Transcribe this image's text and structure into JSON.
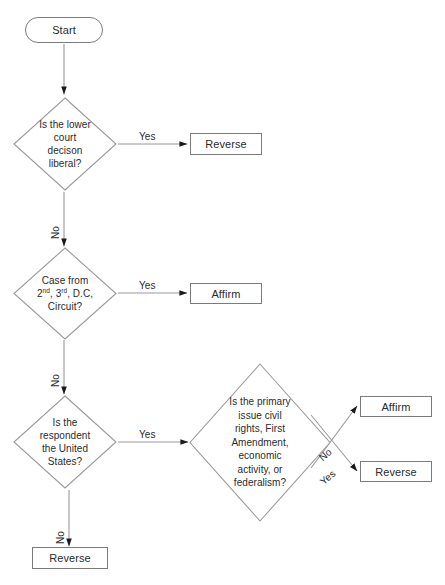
{
  "diagram": {
    "type": "flowchart",
    "colors": {
      "stroke": "#7b7b7b",
      "arrow": "#1a1a1a",
      "text": "#2b2b2b",
      "background": "#ffffff"
    },
    "nodes": {
      "start": {
        "label": "Start",
        "shape": "terminator"
      },
      "decision_liberal": {
        "shape": "diamond",
        "lines": [
          "Is the lower",
          "court",
          "decison",
          "liberal?"
        ]
      },
      "decision_circuit": {
        "shape": "diamond",
        "lines": [
          "Case from",
          "2nd, 3rd, D.C,",
          "Circuit?"
        ],
        "ordinals": {
          "second": "2",
          "second_sup": "nd",
          "third": "3",
          "third_sup": "rd",
          "tail": ", D.C,"
        }
      },
      "decision_respondent": {
        "shape": "diamond",
        "lines": [
          "Is the",
          "respondent",
          "the United",
          "States?"
        ]
      },
      "decision_issue": {
        "shape": "diamond",
        "lines": [
          "Is the primary",
          "issue civil",
          "rights, First",
          "Amendment,",
          "economic",
          "activity, or",
          "federalism?"
        ]
      },
      "reverse_top": {
        "label": "Reverse",
        "shape": "box"
      },
      "affirm_middle": {
        "label": "Affirm",
        "shape": "box"
      },
      "reverse_bottom": {
        "label": "Reverse",
        "shape": "box"
      },
      "affirm_right": {
        "label": "Affirm",
        "shape": "box"
      },
      "reverse_right": {
        "label": "Reverse",
        "shape": "box"
      }
    },
    "edge_labels": {
      "liberal_yes": "Yes",
      "liberal_no": "No",
      "circuit_yes": "Yes",
      "circuit_no": "No",
      "respondent_yes": "Yes",
      "respondent_no": "No",
      "issue_no": "No",
      "issue_yes": "Yes"
    }
  }
}
